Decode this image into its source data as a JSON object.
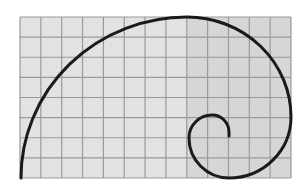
{
  "diagram": {
    "title": "",
    "type": "golden-spiral-on-grid",
    "grid": {
      "x0": 20,
      "y0": 17,
      "x1": 291,
      "y1": 178,
      "cols": 13,
      "rows": 8,
      "background": "#e2e2e2",
      "line_color": "#9a9a9a",
      "shade_region": {
        "x": 187,
        "y": 17,
        "w": 104,
        "h": 161,
        "color": "#d6d6d6"
      }
    },
    "spiral": {
      "color": "#1a1a1a",
      "stroke_width": 3,
      "path": "M21,178 A166,161 0 0 1 187,17 A104,100 0 0 1 291,117 A62,61 0 0 1 229,178 A40,40 0 0 1 189,138 A23,23 0 0 1 212,115 A17,17 0 0 1 229,132 L229,136"
    }
  }
}
